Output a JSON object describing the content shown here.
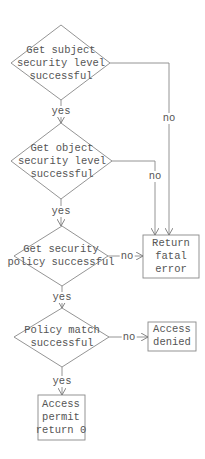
{
  "diagram": {
    "type": "flowchart",
    "nodes": [
      {
        "id": "d1",
        "shape": "diamond",
        "text": "Get subject\nsecurity level\nsuccessful"
      },
      {
        "id": "d2",
        "shape": "diamond",
        "text": "Get object\nsecurity level\nsuccessful"
      },
      {
        "id": "d3",
        "shape": "diamond",
        "text": "Get security\npolicy successful"
      },
      {
        "id": "d4",
        "shape": "diamond",
        "text": "Policy match\nsuccessful"
      },
      {
        "id": "fatal",
        "shape": "box",
        "text": "Return\nfatal\nerror"
      },
      {
        "id": "denied",
        "shape": "box",
        "text": "Access\ndenied"
      },
      {
        "id": "permit",
        "shape": "box",
        "text": "Access\npermit\nreturn 0"
      }
    ],
    "edges": [
      {
        "from": "d1",
        "to": "d2",
        "label": "yes"
      },
      {
        "from": "d1",
        "to": "fatal",
        "label": "no"
      },
      {
        "from": "d2",
        "to": "d3",
        "label": "yes"
      },
      {
        "from": "d2",
        "to": "fatal",
        "label": "no"
      },
      {
        "from": "d3",
        "to": "d4",
        "label": "yes"
      },
      {
        "from": "d3",
        "to": "fatal",
        "label": "no"
      },
      {
        "from": "d4",
        "to": "permit",
        "label": "yes"
      },
      {
        "from": "d4",
        "to": "denied",
        "label": "no"
      }
    ],
    "labels": {
      "yes": "yes",
      "no": "no"
    }
  }
}
